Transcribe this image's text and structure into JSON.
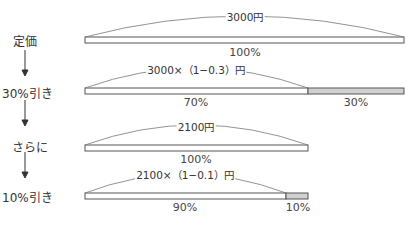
{
  "steps": [
    {
      "label": "定価"
    },
    {
      "label": "30%引き"
    },
    {
      "label": "さらに"
    },
    {
      "label": "10%引き"
    }
  ],
  "bars": [
    {
      "caption": "3000円",
      "segments": [
        {
          "pct": "100%",
          "fill": "#ffffff"
        }
      ]
    },
    {
      "caption": "3000×（1−0.3）円",
      "segments": [
        {
          "pct": "70%",
          "fill": "#ffffff"
        },
        {
          "pct": "30%",
          "fill": "#d0d0d0"
        }
      ]
    },
    {
      "caption": "2100円",
      "segments": [
        {
          "pct": "100%",
          "fill": "#ffffff"
        }
      ]
    },
    {
      "caption": "2100×（1−0.1）円",
      "segments": [
        {
          "pct": "90%",
          "fill": "#ffffff"
        },
        {
          "pct": "10%",
          "fill": "#d0d0d0"
        }
      ]
    }
  ],
  "colors": {
    "line": "#555555",
    "shade": "#d0d0d0"
  }
}
